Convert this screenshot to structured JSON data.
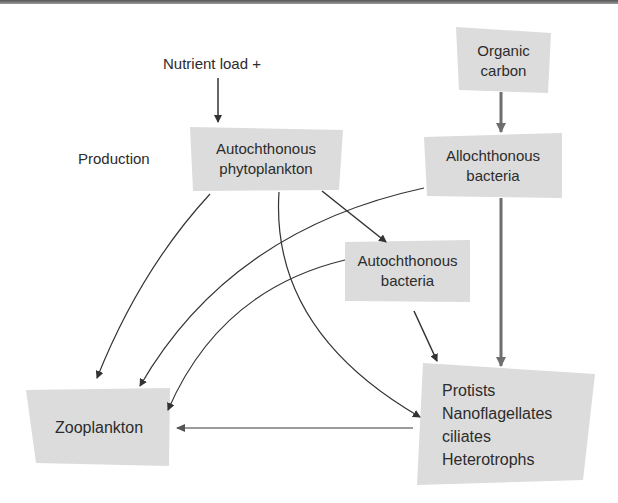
{
  "diagram": {
    "type": "flow-diagram",
    "topic": "Aquatic microbial food web",
    "labels": {
      "nutrient_load": "Nutrient load +",
      "production": "Production"
    },
    "nodes": {
      "organic_carbon": {
        "lines": [
          "Organic",
          "carbon"
        ]
      },
      "autochthonous_phytoplankton": {
        "lines": [
          "Autochthonous",
          "phytoplankton"
        ]
      },
      "allochthonous_bacteria": {
        "lines": [
          "Allochthonous",
          "bacteria"
        ]
      },
      "autochthonous_bacteria": {
        "lines": [
          "Autochthonous",
          "bacteria"
        ]
      },
      "protists": {
        "lines": [
          "Protists",
          "Nanoflagellates",
          "ciliates",
          "Heterotrophs"
        ]
      },
      "zooplankton": {
        "lines": [
          "Zooplankton"
        ]
      }
    },
    "edges": [
      {
        "from": "nutrient_load",
        "to": "autochthonous_phytoplankton",
        "style": "black-straight"
      },
      {
        "from": "organic_carbon",
        "to": "allochthonous_bacteria",
        "style": "gray-thick"
      },
      {
        "from": "allochthonous_bacteria",
        "to": "protists",
        "style": "gray-thick"
      },
      {
        "from": "autochthonous_phytoplankton",
        "to": "autochthonous_bacteria",
        "style": "black-straight"
      },
      {
        "from": "autochthonous_bacteria",
        "to": "protists",
        "style": "black-straight"
      },
      {
        "from": "autochthonous_phytoplankton",
        "to": "zooplankton",
        "style": "thin-curve"
      },
      {
        "from": "allochthonous_bacteria",
        "to": "zooplankton",
        "style": "thin-curve"
      },
      {
        "from": "autochthonous_bacteria",
        "to": "zooplankton",
        "style": "thin-curve"
      },
      {
        "from": "autochthonous_phytoplankton",
        "to": "protists",
        "style": "thin-curve"
      },
      {
        "from": "protists",
        "to": "zooplankton",
        "style": "gray-thin"
      }
    ],
    "colors": {
      "box_fill": "#dcdcdc",
      "line": "#333333",
      "thick_arrow": "#6e6e6e",
      "thin_gray_arrow": "#7a7a7a"
    }
  }
}
